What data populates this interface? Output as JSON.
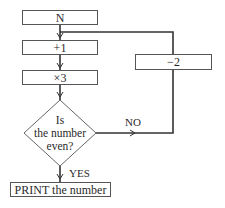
{
  "flowchart": {
    "nodes": [
      {
        "id": "start",
        "shape": "process",
        "label": "N"
      },
      {
        "id": "add1",
        "shape": "process",
        "label": "+1"
      },
      {
        "id": "times3",
        "shape": "process",
        "label": "×3"
      },
      {
        "id": "decision",
        "shape": "decision",
        "lines": [
          "Is",
          "the number",
          "even?"
        ]
      },
      {
        "id": "minus2",
        "shape": "process",
        "label": "−2"
      },
      {
        "id": "print",
        "shape": "process",
        "label": "PRINT the number"
      }
    ],
    "edges": [
      {
        "from": "start",
        "to": "add1",
        "label": ""
      },
      {
        "from": "add1",
        "to": "times3",
        "label": ""
      },
      {
        "from": "times3",
        "to": "decision",
        "label": ""
      },
      {
        "from": "decision",
        "to": "minus2",
        "label": "NO"
      },
      {
        "from": "minus2",
        "to": "add1",
        "label": ""
      },
      {
        "from": "decision",
        "to": "print",
        "label": "YES"
      }
    ]
  }
}
